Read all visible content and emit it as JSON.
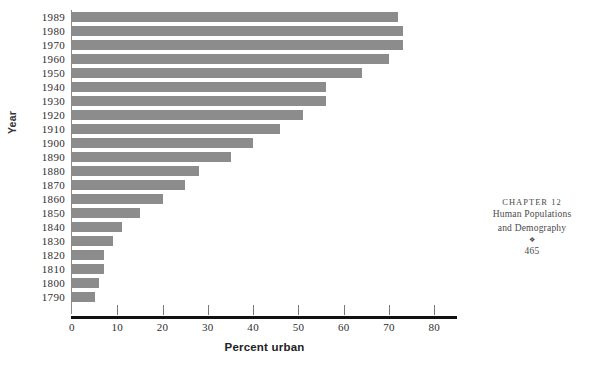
{
  "chart_data": {
    "type": "bar",
    "orientation": "horizontal",
    "title": "",
    "xlabel": "Percent urban",
    "ylabel": "Year",
    "xlim": [
      0,
      85
    ],
    "xticks": [
      0,
      10,
      20,
      30,
      40,
      50,
      60,
      70,
      80
    ],
    "xtick_labels": [
      "0",
      "10",
      "20",
      "30",
      "40",
      "50",
      "60",
      "70",
      "80"
    ],
    "grid": false,
    "legend": null,
    "bar_color": "#8c8c8c",
    "axis_color": "#111111",
    "categories": [
      "1989",
      "1980",
      "1970",
      "1960",
      "1950",
      "1940",
      "1930",
      "1920",
      "1910",
      "1900",
      "1890",
      "1880",
      "1870",
      "1860",
      "1850",
      "1840",
      "1830",
      "1820",
      "1810",
      "1800",
      "1790"
    ],
    "values": [
      72,
      73,
      73,
      70,
      64,
      56,
      56,
      51,
      46,
      40,
      35,
      28,
      25,
      20,
      15,
      11,
      9,
      7,
      7,
      6,
      5
    ],
    "series": [
      {
        "name": "Percent urban",
        "values": [
          72,
          73,
          73,
          70,
          64,
          56,
          56,
          51,
          46,
          40,
          35,
          28,
          25,
          20,
          15,
          11,
          9,
          7,
          7,
          6,
          5
        ]
      }
    ]
  },
  "book_footer": {
    "chapter": "Chapter 12",
    "title_line_1": "Human Populations",
    "title_line_2": "and Demography",
    "ornament": "❖",
    "page": "465"
  }
}
